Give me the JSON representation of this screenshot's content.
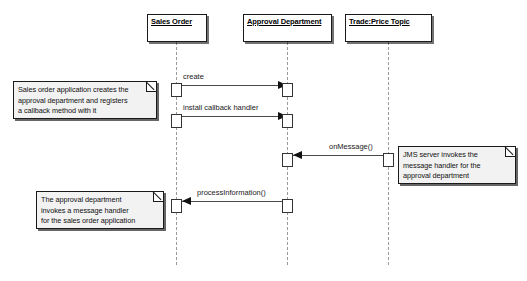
{
  "diagram": {
    "type": "uml-sequence-diagram",
    "background_color": "#ffffff",
    "line_color": "#4a4a4a",
    "lifeline_color": "#9a9a9a",
    "note_fill": "#f2f2f2"
  },
  "lifelines": [
    {
      "id": "sales-order",
      "label": "Sales Order"
    },
    {
      "id": "approval-department",
      "label": "Approval Department"
    },
    {
      "id": "trade-price-topic",
      "label": "Trade:Price Topic"
    }
  ],
  "messages": [
    {
      "id": "create",
      "label": "create",
      "from": "sales-order",
      "to": "approval-department",
      "direction": "right"
    },
    {
      "id": "install-callback-handler",
      "label": "install callback handler",
      "from": "sales-order",
      "to": "approval-department",
      "direction": "right"
    },
    {
      "id": "on-message",
      "label": "onMessage()",
      "from": "trade-price-topic",
      "to": "approval-department",
      "direction": "left"
    },
    {
      "id": "process-information",
      "label": "processInformation()",
      "from": "approval-department",
      "to": "sales-order",
      "direction": "left"
    }
  ],
  "notes": [
    {
      "id": "note-sales-order",
      "lines": [
        "Sales order application creates the",
        "approval department and registers",
        "a callback method with it"
      ]
    },
    {
      "id": "note-jms-server",
      "lines": [
        "JMS server invokes the",
        "message handler for the",
        "approval department"
      ]
    },
    {
      "id": "note-approval-department",
      "lines": [
        "The approval department",
        "invokes a message handler",
        "for the sales order application"
      ]
    }
  ]
}
